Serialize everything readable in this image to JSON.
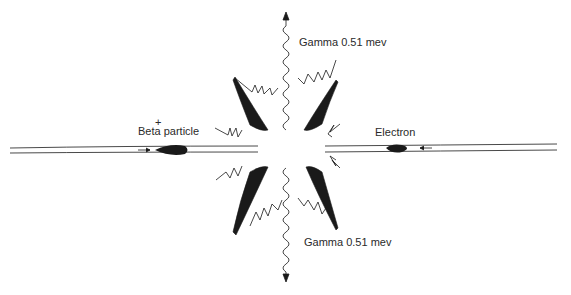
{
  "diagram": {
    "labels": {
      "beta_charge": "+",
      "beta_particle": "Beta particle",
      "electron": "Electron",
      "gamma_top": "Gamma 0.51 mev",
      "gamma_bottom": "Gamma 0.51 mev"
    },
    "colors": {
      "ink": "#1a1a1a",
      "background": "#ffffff"
    }
  }
}
